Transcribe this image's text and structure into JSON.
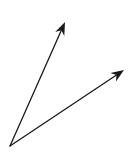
{
  "diagram": {
    "background": "#ffffff",
    "stroke_color": "#1a1a1a",
    "stroke_width": 1.3,
    "origin": {
      "x": 10,
      "y": 146
    },
    "vectors": [
      {
        "name": "vector-steep",
        "tip": {
          "x": 65,
          "y": 22
        }
      },
      {
        "name": "vector-shallow",
        "tip": {
          "x": 124,
          "y": 70
        }
      }
    ]
  }
}
